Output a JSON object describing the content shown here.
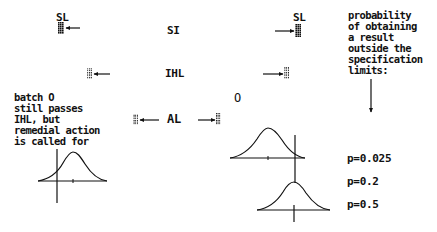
{
  "limits": {
    "sl_left": "SL",
    "si": "SI",
    "sl_right": "SL",
    "ihl": "IHL",
    "al": "AL",
    "batch_marker": "O"
  },
  "annotations": {
    "probability_note": "probability\nof obtaining\na result\noutside the\nspecification\nlimits:",
    "batch_note": "batch O\nstill passes\nIHL, but\nremedial action\nis called for"
  },
  "probabilities": [
    {
      "label": "p=0.025"
    },
    {
      "label": "p=0.2"
    },
    {
      "label": "p=0.5"
    }
  ],
  "icons": {
    "marker_sl": "dense-hatched-marker",
    "marker_ihl": "dotted-marker",
    "marker_al": "dotted-marker",
    "arrow": "arrow"
  },
  "colors": {
    "ink": "#111111",
    "background": "#ffffff"
  }
}
